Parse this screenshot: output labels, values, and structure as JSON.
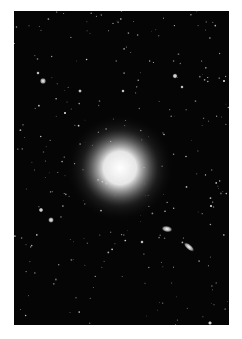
{
  "image": {
    "subject": "elliptical galaxy with surrounding star field",
    "background_color": "#ffffff",
    "frame": {
      "x": 14,
      "y": 11,
      "width": 215,
      "height": 314,
      "color": "#050505"
    },
    "main_galaxy": {
      "cx": 106,
      "cy": 157,
      "core_r": 24,
      "halo_r": 55
    },
    "companion_galaxies": [
      {
        "cx": 153,
        "cy": 218,
        "rx": 6,
        "ry": 3.5,
        "rotate": 10
      },
      {
        "cx": 175,
        "cy": 236,
        "rx": 7,
        "ry": 3,
        "rotate": 40
      }
    ],
    "bright_stars": [
      {
        "x": 29,
        "y": 70,
        "r": 2.2
      },
      {
        "x": 24,
        "y": 62,
        "r": 1.2
      },
      {
        "x": 161,
        "y": 65,
        "r": 1.8
      },
      {
        "x": 168,
        "y": 76,
        "r": 1.2
      },
      {
        "x": 27,
        "y": 199,
        "r": 1.6
      },
      {
        "x": 37,
        "y": 209,
        "r": 2.0
      },
      {
        "x": 66,
        "y": 80,
        "r": 1.3
      },
      {
        "x": 109,
        "y": 80,
        "r": 1.2
      },
      {
        "x": 128,
        "y": 231,
        "r": 1.2
      },
      {
        "x": 196,
        "y": 312,
        "r": 1.4
      },
      {
        "x": 197,
        "y": 195,
        "r": 1.0
      },
      {
        "x": 51,
        "y": 102,
        "r": 1.0
      },
      {
        "x": 210,
        "y": 70,
        "r": 1.0
      }
    ]
  }
}
